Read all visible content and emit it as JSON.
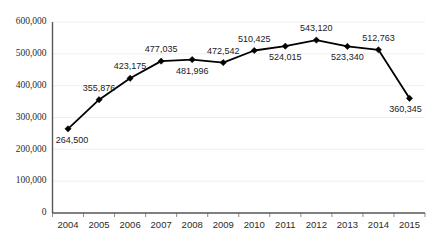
{
  "chart_data": {
    "type": "line",
    "title": "",
    "subtitle": "",
    "xlabel": "",
    "ylabel": "",
    "categories": [
      "2004",
      "2005",
      "2006",
      "2007",
      "2008",
      "2009",
      "2010",
      "2011",
      "2012",
      "2013",
      "2014",
      "2015"
    ],
    "values": [
      264500,
      355876,
      423175,
      477035,
      481996,
      472542,
      510425,
      524015,
      543120,
      523340,
      512763,
      360345
    ],
    "data_labels": [
      "264,500",
      "355,876",
      "423,175",
      "477,035",
      "481,996",
      "472,542",
      "510,425",
      "524,015",
      "543,120",
      "523,340",
      "512,763",
      "360,345"
    ],
    "label_positions": [
      "below",
      "above",
      "above",
      "above",
      "below",
      "above",
      "above",
      "below",
      "above",
      "below",
      "above",
      "below"
    ],
    "ylim": [
      0,
      600000
    ],
    "ytick_values": [
      0,
      100000,
      200000,
      300000,
      400000,
      500000,
      600000
    ],
    "ytick_labels": [
      "0",
      "100,000",
      "200,000",
      "300,000",
      "400,000",
      "500,000",
      "600,000"
    ],
    "grid": true,
    "legend": "none",
    "series": [
      {
        "name": "",
        "values": [
          264500,
          355876,
          423175,
          477035,
          481996,
          472542,
          510425,
          524015,
          543120,
          523340,
          512763,
          360345
        ],
        "line_color": "#000000",
        "marker": "diamond",
        "marker_color": "#000000"
      }
    ]
  },
  "colors": {
    "background": "#ffffff",
    "line": "#000000",
    "marker": "#000000",
    "axis": "#595959",
    "gridline": "#f0f0f0",
    "text": "#2b2b2b"
  }
}
